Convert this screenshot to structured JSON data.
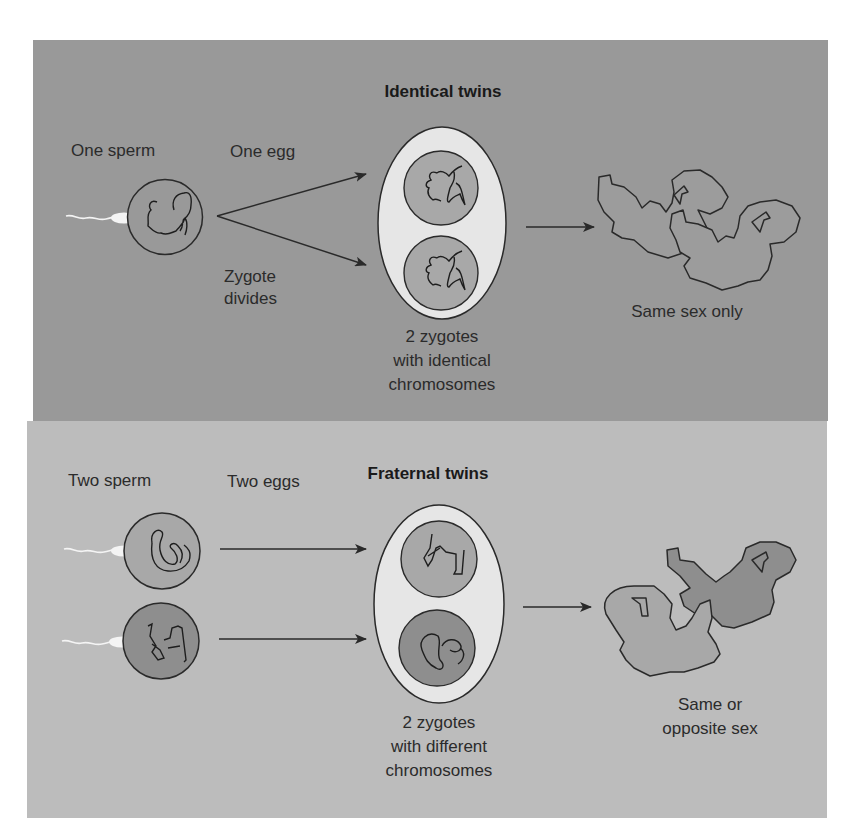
{
  "colors": {
    "page_bg": "#ffffff",
    "panel_identical": "#999999",
    "panel_fraternal": "#bcbcbc",
    "egg_membrane": "#e6e6e6",
    "cell_light": "#a8a8a8",
    "cell_dark": "#8e8e8e",
    "outline": "#2a2a2a",
    "sperm": "#f4f4f4"
  },
  "identical": {
    "title": "Identical twins",
    "sperm_label": "One sperm",
    "egg_label": "One egg",
    "divide_label_line1": "Zygote",
    "divide_label_line2": "divides",
    "zygotes_line1": "2 zygotes",
    "zygotes_line2": "with identical",
    "zygotes_line3": "chromosomes",
    "outcome": "Same sex only"
  },
  "fraternal": {
    "title": "Fraternal twins",
    "sperm_label": "Two sperm",
    "egg_label": "Two eggs",
    "zygotes_line1": "2 zygotes",
    "zygotes_line2": "with different",
    "zygotes_line3": "chromosomes",
    "outcome_line1": "Same or",
    "outcome_line2": "opposite sex"
  }
}
